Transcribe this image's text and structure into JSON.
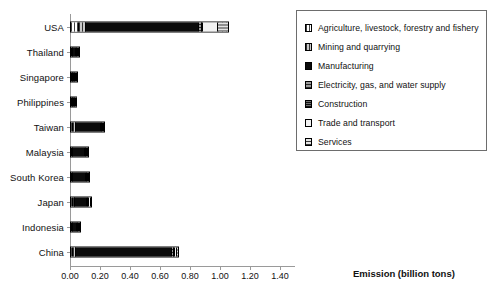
{
  "chart_data": {
    "type": "bar",
    "orientation": "horizontal",
    "stacked": true,
    "title": "",
    "xlabel": "Emission (billion tons)",
    "ylabel": "",
    "xlim": [
      0.0,
      1.5
    ],
    "xticks": [
      "0.00",
      "0.20",
      "0.40",
      "0.60",
      "0.80",
      "1.00",
      "1.20",
      "1.40"
    ],
    "xtick_values": [
      0.0,
      0.2,
      0.4,
      0.6,
      0.8,
      1.0,
      1.2,
      1.4
    ],
    "grid": false,
    "legend_position": "right",
    "categories": [
      "USA",
      "Thailand",
      "Singapore",
      "Philippines",
      "Taiwan",
      "Malaysia",
      "South Korea",
      "Japan",
      "Indonesia",
      "China"
    ],
    "series": [
      {
        "name": "Agriculture, livestock, forestry and fishery",
        "pattern": "p-agri",
        "values": [
          0.045,
          0.002,
          0.001,
          0.003,
          0.004,
          0.003,
          0.003,
          0.004,
          0.004,
          0.006
        ]
      },
      {
        "name": "Mining and quarrying",
        "pattern": "p-mining",
        "values": [
          0.045,
          0.002,
          0.001,
          0.002,
          0.022,
          0.004,
          0.003,
          0.014,
          0.004,
          0.024
        ]
      },
      {
        "name": "Manufacturing",
        "pattern": "p-manu",
        "values": [
          0.755,
          0.04,
          0.033,
          0.024,
          0.172,
          0.085,
          0.097,
          0.088,
          0.044,
          0.64
        ]
      },
      {
        "name": "Electricity, gas, and water supply",
        "pattern": "p-elec",
        "values": [
          0.02,
          0.002,
          0.001,
          0.002,
          0.004,
          0.004,
          0.004,
          0.004,
          0.002,
          0.01
        ]
      },
      {
        "name": "Construction",
        "pattern": "p-constr",
        "values": [
          0.008,
          0.001,
          0.001,
          0.001,
          0.003,
          0.003,
          0.003,
          0.003,
          0.002,
          0.008
        ]
      },
      {
        "name": "Trade and transport",
        "pattern": "p-trade",
        "values": [
          0.1,
          0.003,
          0.002,
          0.002,
          0.008,
          0.008,
          0.008,
          0.012,
          0.003,
          0.014
        ]
      },
      {
        "name": "Services",
        "pattern": "p-serv",
        "values": [
          0.075,
          0.003,
          0.002,
          0.002,
          0.01,
          0.005,
          0.005,
          0.008,
          0.003,
          0.014
        ]
      }
    ],
    "totals": [
      1.048,
      0.053,
      0.041,
      0.036,
      0.223,
      0.112,
      0.123,
      0.133,
      0.062,
      0.716
    ]
  },
  "legend": {
    "items": [
      {
        "label": "Agriculture, livestock, forestry and fishery"
      },
      {
        "label": "Mining and quarrying"
      },
      {
        "label": "Manufacturing"
      },
      {
        "label": "Electricity, gas, and water supply"
      },
      {
        "label": "Construction"
      },
      {
        "label": "Trade and transport"
      },
      {
        "label": "Services"
      }
    ]
  },
  "caption": ""
}
